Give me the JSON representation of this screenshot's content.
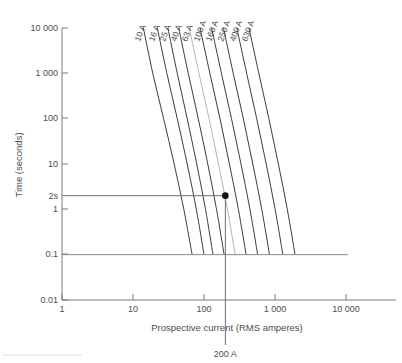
{
  "chart_data": {
    "type": "line",
    "title": "",
    "xlabel": "Prospective current (RMS amperes)",
    "ylabel": "Time (seconds)",
    "xscale": "log",
    "yscale": "log",
    "xlim": [
      1,
      100000
    ],
    "ylim": [
      0.01,
      10000
    ],
    "grid": false,
    "legend": "inline-curve-labels",
    "x_ticks": [
      {
        "value": 1,
        "label": "1"
      },
      {
        "value": 10,
        "label": "10"
      },
      {
        "value": 100,
        "label": "100"
      },
      {
        "value": 1000,
        "label": "1 000"
      },
      {
        "value": 10000,
        "label": "10 000"
      }
    ],
    "y_ticks": [
      {
        "value": 10000,
        "label": "10 000"
      },
      {
        "value": 1000,
        "label": "1 000"
      },
      {
        "value": 100,
        "label": "100"
      },
      {
        "value": 10,
        "label": "10"
      },
      {
        "value": 1,
        "label": "1"
      },
      {
        "value": 0.1,
        "label": "0.1"
      },
      {
        "value": 0.01,
        "label": "0.01"
      }
    ],
    "series": [
      {
        "name": "10 A",
        "label": "10 A",
        "style": "dark",
        "x": [
          14,
          19,
          27,
          38,
          52,
          68
        ],
        "y": [
          10000,
          1000,
          100,
          10,
          1,
          0.1
        ]
      },
      {
        "name": "16 A",
        "label": "16 A",
        "style": "dark",
        "x": [
          22,
          30,
          42,
          58,
          78,
          100
        ],
        "y": [
          10000,
          1000,
          100,
          10,
          1,
          0.1
        ]
      },
      {
        "name": "25 A",
        "label": "25 A",
        "style": "dark",
        "x": [
          31,
          42,
          58,
          79,
          105,
          134
        ],
        "y": [
          10000,
          1000,
          100,
          10,
          1,
          0.1
        ]
      },
      {
        "name": "40 A",
        "label": "40 A",
        "style": "dark",
        "x": [
          44,
          60,
          83,
          113,
          150,
          192
        ],
        "y": [
          10000,
          1000,
          100,
          10,
          1,
          0.1
        ]
      },
      {
        "name": "63 A",
        "label": "63 A",
        "style": "light",
        "x": [
          62,
          85,
          118,
          160,
          214,
          275
        ],
        "y": [
          10000,
          1000,
          100,
          10,
          1,
          0.1
        ]
      },
      {
        "name": "100 A",
        "label": "100 A",
        "style": "dark",
        "x": [
          88,
          121,
          168,
          228,
          305,
          392
        ],
        "y": [
          10000,
          1000,
          100,
          10,
          1,
          0.1
        ]
      },
      {
        "name": "160 A",
        "label": "160 A",
        "style": "dark",
        "x": [
          128,
          176,
          244,
          332,
          444,
          570
        ],
        "y": [
          10000,
          1000,
          100,
          10,
          1,
          0.1
        ]
      },
      {
        "name": "250 A",
        "label": "250 A",
        "style": "dark",
        "x": [
          188,
          258,
          358,
          487,
          651,
          836
        ],
        "y": [
          10000,
          1000,
          100,
          10,
          1,
          0.1
        ]
      },
      {
        "name": "400 A",
        "label": "400 A",
        "style": "dark",
        "x": [
          290,
          399,
          553,
          752,
          1005,
          1290
        ],
        "y": [
          10000,
          1000,
          100,
          10,
          1,
          0.1
        ]
      },
      {
        "name": "630 A",
        "label": "630 A",
        "style": "dark",
        "x": [
          430,
          592,
          820,
          1115,
          1490,
          1915
        ],
        "y": [
          10000,
          1000,
          100,
          10,
          1,
          0.1
        ]
      }
    ],
    "annotations": [
      {
        "name": "operating-point",
        "type": "point",
        "x": 200,
        "y": 2,
        "label": ""
      },
      {
        "name": "time-guide",
        "type": "hline",
        "y": 2,
        "label": "2s"
      },
      {
        "name": "current-guide",
        "type": "vline",
        "x": 200,
        "label": "200 A"
      },
      {
        "name": "lower-time-limit",
        "type": "hline",
        "y": 0.1,
        "label": "0.1"
      }
    ],
    "y_axis_extra_label": "2s",
    "x_axis_extra_label": "200 A"
  }
}
